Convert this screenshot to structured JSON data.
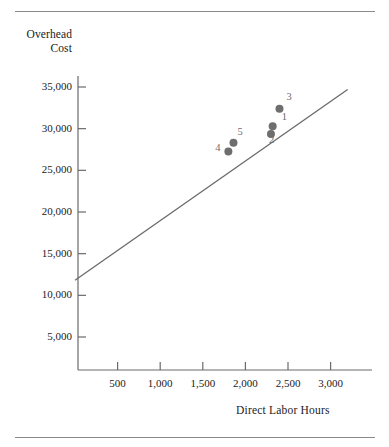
{
  "figure": {
    "top_rule": "horizontal-rule",
    "bottom_rule": "horizontal-rule"
  },
  "chart_data": {
    "type": "scatter",
    "title": "",
    "xlabel": "Direct Labor Hours",
    "ylabel": "Overhead\nCost",
    "ylabel_line1": "Overhead",
    "ylabel_line2": "Cost",
    "xlim": [
      0,
      3350
    ],
    "ylim": [
      0,
      37500
    ],
    "grid": false,
    "legend": "none",
    "xticks": [
      500,
      1000,
      1500,
      2000,
      2500,
      3000
    ],
    "xtick_labels": [
      "500",
      "1,000",
      "1,500",
      "2,000",
      "2,500",
      "3,000"
    ],
    "yticks": [
      5000,
      10000,
      15000,
      20000,
      25000,
      30000,
      35000
    ],
    "ytick_labels": [
      "5,000",
      "10,000",
      "15,000",
      "20,000",
      "25,000",
      "30,000",
      "35,000"
    ],
    "marker_color": "#6e6e6e",
    "line_color": "#6a6a6a",
    "axis_color": "#6a6a6a",
    "points": [
      {
        "label": "1",
        "x": 2320,
        "y": 30300,
        "label_dx": 9,
        "label_dy": -9
      },
      {
        "label": "2",
        "x": 2300,
        "y": 29350,
        "label_dx": -2,
        "label_dy": 6
      },
      {
        "label": "3",
        "x": 2400,
        "y": 32400,
        "label_dx": 7,
        "label_dy": -12
      },
      {
        "label": "4",
        "x": 1800,
        "y": 27250,
        "label_dx": -13,
        "label_dy": -4
      },
      {
        "label": "5",
        "x": 1860,
        "y": 28300,
        "label_dx": 4,
        "label_dy": -11
      }
    ],
    "trend_line": {
      "name": "regression-line",
      "x_start": 0,
      "y_start": 11800,
      "x_end": 3200,
      "y_end": 34700
    }
  }
}
